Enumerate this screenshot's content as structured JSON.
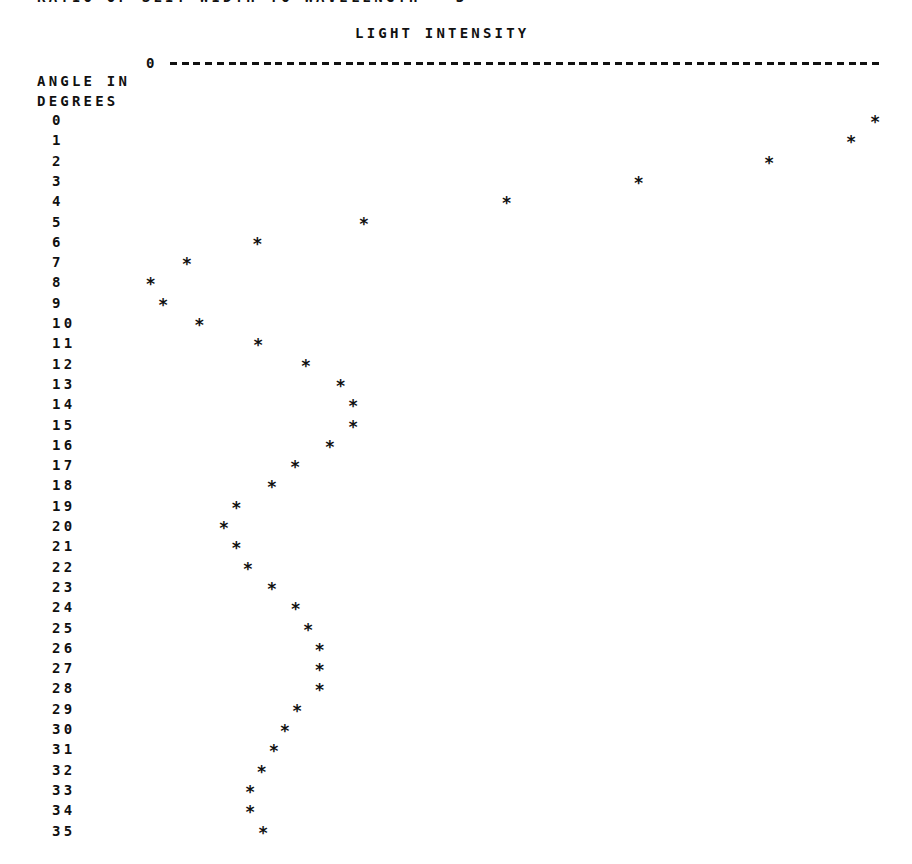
{
  "header": {
    "clipped_title": "RATIO OF SLIT WIDTH TO WAVELENGTH = 3",
    "axis_title": "LIGHT INTENSITY",
    "axis_zero_label": "0",
    "y_label_line1": "ANGLE IN",
    "y_label_line2": "DEGREES",
    "marker_glyph": "*"
  },
  "chart_data": {
    "type": "scatter",
    "title": "RATIO OF SLIT WIDTH TO WAVELENGTH = 3",
    "xlabel": "LIGHT INTENSITY",
    "ylabel": "ANGLE IN DEGREES",
    "orientation": "horizontal (angle down rows, intensity across columns)",
    "x_axis_zero_label": "0",
    "xlim": [
      0,
      1
    ],
    "ylim": [
      0,
      35
    ],
    "grid": false,
    "legend": null,
    "marker": "*",
    "x": [
      0,
      1,
      2,
      3,
      4,
      5,
      6,
      7,
      8,
      9,
      10,
      11,
      12,
      13,
      14,
      15,
      16,
      17,
      18,
      19,
      20,
      21,
      22,
      23,
      24,
      25,
      26,
      27,
      28,
      29,
      30,
      31,
      32,
      33,
      34,
      35
    ],
    "values": [
      1.0,
      0.967,
      0.854,
      0.674,
      0.492,
      0.295,
      0.148,
      0.051,
      0.001,
      0.018,
      0.068,
      0.149,
      0.215,
      0.263,
      0.28,
      0.28,
      0.248,
      0.2,
      0.168,
      0.119,
      0.102,
      0.119,
      0.135,
      0.168,
      0.201,
      0.218,
      0.234,
      0.234,
      0.234,
      0.203,
      0.186,
      0.171,
      0.154,
      0.138,
      0.138,
      0.156
    ]
  }
}
